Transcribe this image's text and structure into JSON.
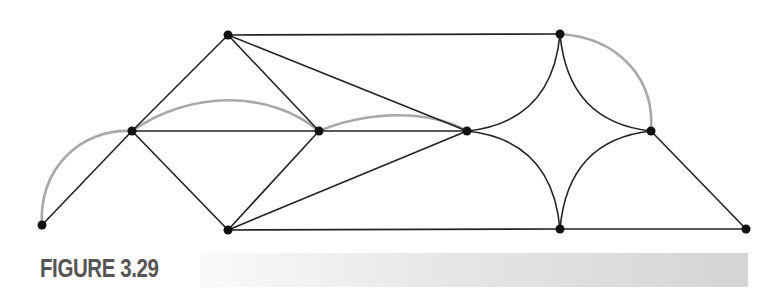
{
  "figure": {
    "label": "FIGURE 3.29",
    "colors": {
      "edge": "#222222",
      "highlight_edge": "#a8a8a8",
      "vertex": "#111111",
      "caption_text": "#555555",
      "caption_bar_start": "#fafafa",
      "caption_bar_end": "#d4d4d4"
    }
  },
  "graph": {
    "vertices": [
      {
        "id": "A",
        "x": 42,
        "y": 225
      },
      {
        "id": "B",
        "x": 132,
        "y": 131
      },
      {
        "id": "C",
        "x": 228,
        "y": 35
      },
      {
        "id": "D",
        "x": 228,
        "y": 230
      },
      {
        "id": "E",
        "x": 319,
        "y": 131
      },
      {
        "id": "F",
        "x": 467,
        "y": 131
      },
      {
        "id": "G",
        "x": 560,
        "y": 34
      },
      {
        "id": "H",
        "x": 560,
        "y": 229
      },
      {
        "id": "I",
        "x": 651,
        "y": 131
      },
      {
        "id": "J",
        "x": 746,
        "y": 229
      }
    ],
    "straight_edges": [
      [
        "A",
        "B"
      ],
      [
        "B",
        "C"
      ],
      [
        "B",
        "D"
      ],
      [
        "B",
        "E"
      ],
      [
        "C",
        "E"
      ],
      [
        "C",
        "F"
      ],
      [
        "C",
        "G"
      ],
      [
        "D",
        "E"
      ],
      [
        "D",
        "F"
      ],
      [
        "D",
        "H"
      ],
      [
        "E",
        "F"
      ],
      [
        "H",
        "J"
      ],
      [
        "I",
        "J"
      ]
    ],
    "curved_edges": [
      {
        "from": "F",
        "to": "G",
        "d": "M467,131 Q552,122 560,34"
      },
      {
        "from": "F",
        "to": "H",
        "d": "M467,131 Q552,140 560,229"
      },
      {
        "from": "G",
        "to": "I",
        "d": "M560,34 Q568,122 651,131"
      },
      {
        "from": "H",
        "to": "I",
        "d": "M560,229 Q568,140 651,131"
      }
    ],
    "highlighted_edges": [
      {
        "from": "A",
        "to": "B",
        "d": "M42,225 C38,170 80,128 132,131"
      },
      {
        "from": "B",
        "to": "E",
        "d": "M132,131 C190,90 270,90 319,131"
      },
      {
        "from": "E",
        "to": "F",
        "d": "M319,131 C370,110 430,110 467,131"
      },
      {
        "from": "G",
        "to": "I",
        "d": "M560,34 C620,38 655,80 651,131"
      }
    ]
  }
}
